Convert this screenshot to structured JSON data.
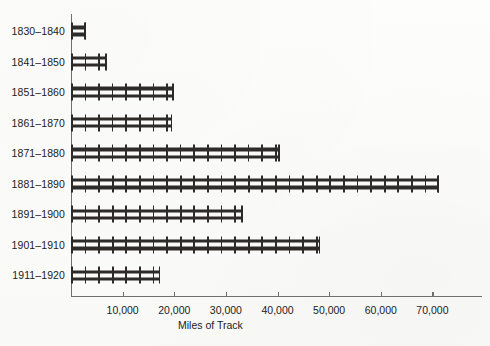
{
  "chart_data": {
    "type": "bar",
    "orientation": "horizontal",
    "title": "",
    "xlabel": "Miles of Track",
    "ylabel": "",
    "categories": [
      "1830–1840",
      "1841–1850",
      "1851–1860",
      "1861–1870",
      "1871–1880",
      "1881–1890",
      "1891–1900",
      "1901–1910",
      "1911–1920"
    ],
    "values": [
      2900,
      7000,
      19900,
      19600,
      40400,
      71300,
      33300,
      48300,
      17300
    ],
    "xlim": [
      0,
      79600
    ],
    "ylim": null,
    "xticks": [
      10000,
      20000,
      30000,
      40000,
      50000,
      60000,
      70000
    ],
    "xtick_labels": [
      "10,000",
      "20,000",
      "30,000",
      "40,000",
      "50,000",
      "60,000",
      "70,000"
    ],
    "grid": false,
    "legend": null,
    "bar_style": "railroad-track",
    "bar_color": "#2c2b28",
    "axis_color": "#6f6f6f",
    "background_color": "#fdfdfb"
  }
}
